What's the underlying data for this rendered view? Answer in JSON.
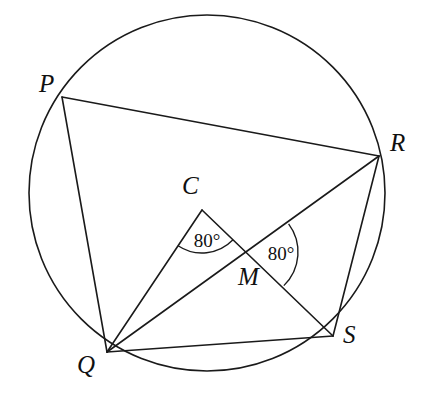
{
  "figure": {
    "background_color": "#ffffff",
    "stroke_color": "#1a1a1a",
    "stroke_width": 1.6,
    "width": 430,
    "height": 398
  },
  "circle": {
    "name": "circumcircle",
    "center": {
      "x": 207,
      "y": 193
    },
    "radius": 178
  },
  "points": [
    {
      "id": "P",
      "label": "P",
      "x": 62,
      "y": 97,
      "label_x": 39,
      "label_y": 71,
      "on_circle": true
    },
    {
      "id": "R",
      "label": "R",
      "x": 379,
      "y": 156,
      "label_x": 390,
      "label_y": 130,
      "on_circle": true
    },
    {
      "id": "Q",
      "label": "Q",
      "x": 107,
      "y": 352,
      "label_x": 77,
      "label_y": 352,
      "on_circle": true
    },
    {
      "id": "S",
      "label": "S",
      "x": 333,
      "y": 336,
      "label_x": 343,
      "label_y": 322,
      "on_circle": true
    },
    {
      "id": "C",
      "label": "C",
      "x": 202,
      "y": 210,
      "label_x": 182,
      "label_y": 173,
      "on_circle": false
    },
    {
      "id": "M",
      "label": "M",
      "x": 251,
      "y": 252,
      "label_x": 238,
      "label_y": 264,
      "on_circle": false
    }
  ],
  "segments": [
    {
      "id": "PR",
      "from": "P",
      "to": "R",
      "name": "chord-p-r"
    },
    {
      "id": "PQ",
      "from": "P",
      "to": "Q",
      "name": "chord-p-q"
    },
    {
      "id": "QR",
      "from": "Q",
      "to": "R",
      "name": "chord-q-r"
    },
    {
      "id": "QS",
      "from": "Q",
      "to": "S",
      "name": "chord-q-s"
    },
    {
      "id": "RS",
      "from": "R",
      "to": "S",
      "name": "chord-r-s"
    },
    {
      "id": "CQ",
      "from": "C",
      "to": "Q",
      "name": "radius-c-q"
    },
    {
      "id": "CS",
      "from": "C",
      "to": "S",
      "name": "radius-c-s"
    }
  ],
  "angles": [
    {
      "id": "angle-at-C",
      "vertex": "C",
      "value": "80°",
      "degrees": 80,
      "arms": [
        "Q",
        "S"
      ],
      "arc_radius": 43,
      "label_x": 207,
      "label_y": 240
    },
    {
      "id": "angle-at-M",
      "vertex": "M",
      "value": "80°",
      "degrees": 80,
      "arms": [
        "R",
        "S"
      ],
      "arc_radius": 47,
      "label_x": 281,
      "label_y": 253
    }
  ]
}
